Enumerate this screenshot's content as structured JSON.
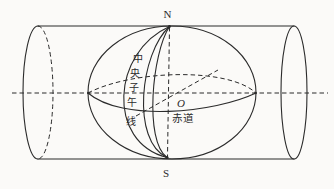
{
  "diagram": {
    "labels": {
      "north_pole": "N",
      "south_pole": "S",
      "center": "O",
      "equator": "赤道",
      "central_meridian": "中央子午线",
      "central_meridian_chars": [
        "中",
        "央",
        "子",
        "午",
        "线"
      ]
    },
    "colors": {
      "line": "#2b2b2b",
      "background": "#fbfaf8"
    }
  }
}
